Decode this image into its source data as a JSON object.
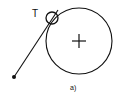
{
  "diagram": {
    "point_label": "T",
    "caption": "a)",
    "stroke_color": "#111111",
    "background": "#ffffff",
    "elements": {
      "large_circle": {
        "cx": 79,
        "cy": 41,
        "r": 33
      },
      "center_cross": {
        "cx": 79,
        "cy": 41,
        "half": 7
      },
      "small_circle": {
        "cx": 52,
        "cy": 18,
        "r": 6
      },
      "line": {
        "x1": 14,
        "y1": 77,
        "x2": 58,
        "y2": 10
      },
      "end_dot": {
        "cx": 14,
        "cy": 77,
        "r": 2
      }
    }
  }
}
